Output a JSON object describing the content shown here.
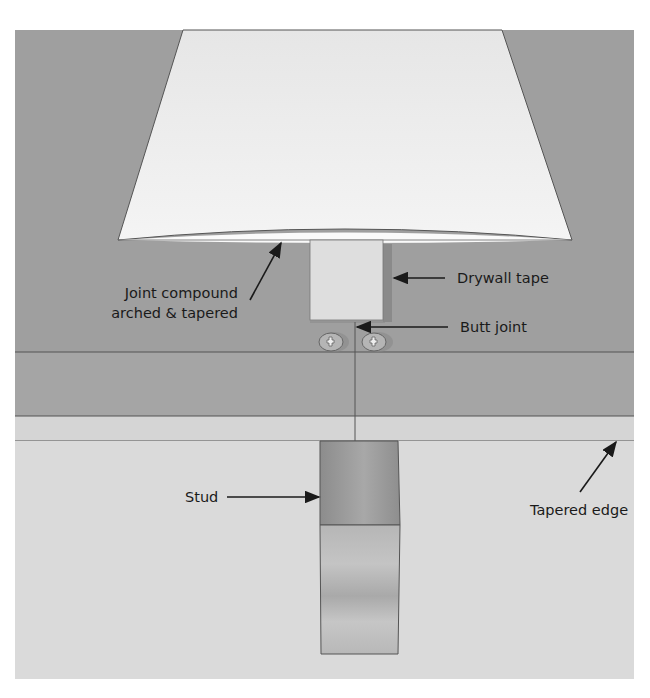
{
  "diagram": {
    "labels": {
      "joint_compound_line1": "Joint compound",
      "joint_compound_line2": "arched & tapered",
      "drywall_tape": "Drywall tape",
      "butt_joint": "Butt joint",
      "stud": "Stud",
      "tapered_edge": "Tapered edge"
    },
    "colors": {
      "background_wall": "#9e9e9e",
      "drywall_face": "#a4a4a4",
      "tapered_strip": "#d6d6d6",
      "lower_area": "#dadada",
      "compound": "#ececec",
      "tape": "#dcdcdc",
      "stud": "#8a8a8a",
      "outline": "#555555"
    }
  }
}
